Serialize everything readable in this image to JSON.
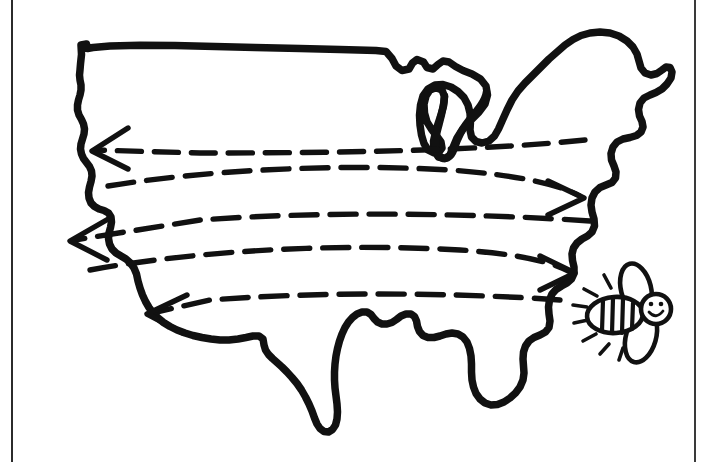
{
  "document": {
    "type": "illustration",
    "medium": "hand-drawn line art",
    "background_color": "#ffffff",
    "ink_color": "#111111",
    "border_color": "#2b2b2b",
    "width": 709,
    "height": 462
  },
  "page_frame": {
    "left_rule": {
      "name": "left-page-rule",
      "x": 11,
      "width": 2,
      "color": "#2b2b2b"
    },
    "right_rule": {
      "name": "right-page-rule",
      "x": 694,
      "width": 2,
      "color": "#3a3a3a"
    }
  },
  "map": {
    "name": "united-states-outline",
    "subject": "contiguous United States",
    "style": "thick hand-drawn marker outline, unfilled",
    "stroke_color": "#111111",
    "stroke_width": 7,
    "fill": "none",
    "features": [
      "northern border with Great Lakes",
      "Michigan mitten peninsula",
      "New England coastline",
      "Florida peninsula",
      "Gulf of Mexico coast",
      "Texas southern tip",
      "Pacific west coast",
      "Pacific Northwest notch"
    ]
  },
  "flow_lines": {
    "name": "airflow-dashed-lines",
    "count": 5,
    "style": "dashed hand-drawn curves spanning the country",
    "stroke_color": "#111111",
    "stroke_width": 6,
    "dash_pattern": "22 14",
    "lines": [
      {
        "id": 1,
        "direction": "westward",
        "arrow_end": "left",
        "label": "upper flow line"
      },
      {
        "id": 2,
        "direction": "eastward",
        "arrow_end": "right",
        "label": "upper-middle flow line"
      },
      {
        "id": 3,
        "direction": "westward",
        "arrow_end": "left",
        "label": "middle flow line"
      },
      {
        "id": 4,
        "direction": "eastward",
        "arrow_end": "right",
        "label": "lower-middle flow line"
      },
      {
        "id": 5,
        "direction": "westward",
        "arrow_end": "left",
        "label": "lower flow line"
      }
    ]
  },
  "arrowheads": {
    "name": "flow-arrowheads",
    "total": 5,
    "pointing_west": 3,
    "pointing_east": 2,
    "stroke_color": "#111111"
  },
  "bee": {
    "name": "cartoon-bee",
    "position": "right of the east coast, lower right of map",
    "stroke_color": "#111111",
    "parts": [
      "striped abdomen",
      "upper wing",
      "lower wing",
      "round head",
      "two eyes",
      "smiling mouth",
      "motion lines"
    ],
    "stripe_count": 4,
    "motion_line_count": 8,
    "expression": "smiling"
  }
}
